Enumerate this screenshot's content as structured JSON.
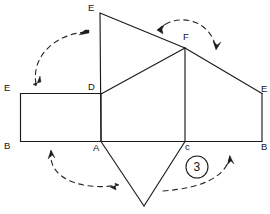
{
  "figure": {
    "background_color": "#ffffff",
    "line_color": "#1b1b1b",
    "dash_color": "#2a2a2a",
    "width": 270,
    "height": 214,
    "vertex_labels": [
      {
        "name": "label-e-top",
        "text": "E",
        "x": 88,
        "y": 3
      },
      {
        "name": "label-f",
        "text": "F",
        "x": 183,
        "y": 32
      },
      {
        "name": "label-d",
        "text": "D",
        "x": 88,
        "y": 82
      },
      {
        "name": "label-e-left",
        "text": "E",
        "x": 4,
        "y": 83
      },
      {
        "name": "label-e-right",
        "text": "E",
        "x": 261,
        "y": 84
      },
      {
        "name": "label-b-left",
        "text": "B",
        "x": 4,
        "y": 141
      },
      {
        "name": "label-a",
        "text": "A",
        "x": 93,
        "y": 143
      },
      {
        "name": "label-c",
        "text": "c",
        "x": 185,
        "y": 142
      },
      {
        "name": "label-b-right",
        "text": "B",
        "x": 261,
        "y": 142
      }
    ],
    "step_badge": {
      "text": "3",
      "cx": 197,
      "cy": 167,
      "r": 11
    },
    "edges": [
      {
        "name": "edge-left-rect-top",
        "d": "M 20.5 93.5 L 101 93.5"
      },
      {
        "name": "edge-left-rect-left",
        "d": "M 20.5 93.5 L 20.5 141.5"
      },
      {
        "name": "edge-baseline",
        "d": "M 20.5 141.5 L 262 141.5"
      },
      {
        "name": "edge-d-to-a",
        "d": "M 101 93.5 L 101 141.5"
      },
      {
        "name": "edge-e-top-to-a",
        "d": "M 100 13 L 101 141.5"
      },
      {
        "name": "edge-e-top-to-f",
        "d": "M 100 13 L 185 48"
      },
      {
        "name": "edge-d-to-f",
        "d": "M 101 94 L 185 48"
      },
      {
        "name": "edge-f-to-c",
        "d": "M 185 48 L 185 141.5"
      },
      {
        "name": "edge-f-to-e-right",
        "d": "M 185 48 L 262 93.5"
      },
      {
        "name": "edge-e-right-vertical",
        "d": "M 262 93.5 L 262 141.5"
      },
      {
        "name": "edge-a-to-apex",
        "d": "M 101 141.5 L 144 206"
      },
      {
        "name": "edge-apex-to-c",
        "d": "M 144 206 L 185 141.5"
      }
    ],
    "arcs": [
      {
        "name": "arc-upper-left",
        "d": "M 36 84 C 31 56, 56 33, 88 32"
      },
      {
        "name": "arc-upper-right",
        "d": "M 158 30 C 175 12, 210 18, 216 48"
      },
      {
        "name": "arc-lower-left",
        "d": "M 51 151 C 47 180, 85 191, 118 185"
      },
      {
        "name": "arc-lower-right",
        "d": "M 163 191 C 202 188, 227 177, 230 155"
      }
    ],
    "arrow_heads": [
      {
        "name": "arrowhead-upper-left-start",
        "d": "M 36 86 L 40 76 L 41 82 L 33 84 Z"
      },
      {
        "name": "arrowhead-upper-left-end",
        "d": "M 89 33 L 79 35 L 85 30 L 89 30 Z"
      },
      {
        "name": "arrowhead-upper-right-start",
        "d": "M 157 30 L 165 24 L 162 29 L 163 34 Z"
      },
      {
        "name": "arrowhead-upper-right-end",
        "d": "M 216 50 L 213 41 L 217 45 L 221 42 Z"
      },
      {
        "name": "arrowhead-lower-left-start",
        "d": "M 51 150 L 48 159 L 52 155 L 55 158 Z"
      },
      {
        "name": "arrowhead-lower-left-end",
        "d": "M 119 185 L 110 187 L 116 190 L 115 183 Z"
      },
      {
        "name": "arrowhead-lower-right-end",
        "d": "M 230 156 L 227 165 L 231 161 L 234 164 Z"
      }
    ]
  }
}
